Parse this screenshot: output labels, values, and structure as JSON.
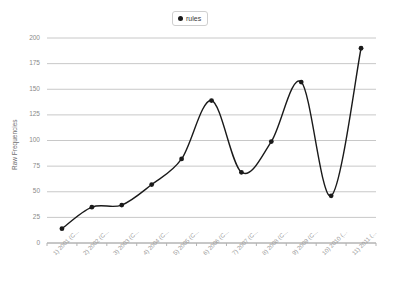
{
  "chart_data": {
    "type": "line",
    "title": "",
    "xlabel": "",
    "ylabel": "Raw Frequencies",
    "ylim": [
      0,
      200
    ],
    "yticks": [
      0,
      25,
      50,
      75,
      100,
      125,
      150,
      175,
      200
    ],
    "grid": true,
    "legend_position": "top-center",
    "categories": [
      "1) 2001 (C...",
      "2) 2002 (C...",
      "3) 2003 (C...",
      "4) 2004 (C...",
      "5) 2005 (C...",
      "6) 2006 (C...",
      "7) 2007 (C...",
      "8) 2008 (C...",
      "9) 2009 (C...",
      "10) 2010 (...",
      "11) 2011 (..."
    ],
    "series": [
      {
        "name": "rules",
        "color": "#1a1a1a",
        "marker": "filled-circle",
        "values": [
          14,
          35,
          37,
          57,
          82,
          139,
          69,
          99,
          157,
          46,
          190
        ]
      }
    ]
  },
  "legend": {
    "entries": [
      {
        "label": "rules",
        "marker_color": "#1a1a1a"
      }
    ]
  },
  "axes": {
    "y_title": "Raw Frequencies",
    "y_tick_labels": [
      "200",
      "175",
      "150",
      "125",
      "100",
      "75",
      "50",
      "25",
      "0"
    ],
    "x_tick_labels": [
      "1) 2001 (C...",
      "2) 2002 (C...",
      "3) 2003 (C...",
      "4) 2004 (C...",
      "5) 2005 (C...",
      "6) 2006 (C...",
      "7) 2007 (C...",
      "8) 2008 (C...",
      "9) 2009 (C...",
      "10) 2010 (...",
      "11) 2011 (..."
    ]
  },
  "style": {
    "background": "#ffffff",
    "grid_color": "#c8c8c8",
    "axis_color": "#b4b4b4",
    "tick_text_color": "#9a9a9a",
    "line_color": "#1a1a1a"
  }
}
